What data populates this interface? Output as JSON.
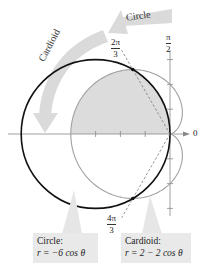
{
  "figure": {
    "pole": {
      "x": 170,
      "y": 134
    },
    "scale": 24.8,
    "colors": {
      "circle": "#111111",
      "cardioid": "#9a9a9a",
      "shade": "#dcdcdc",
      "axis": "#777777",
      "arrow_band": "#d9d9d9",
      "callout_bg": "#e9e9e9"
    },
    "axis_labels": {
      "zero": "0",
      "half_pi_num": "π",
      "half_pi_den": "2"
    },
    "angle_labels": {
      "upper": {
        "num": "2π",
        "den": "3"
      },
      "lower": {
        "num": "4π",
        "den": "3"
      }
    },
    "arrows": {
      "circle_label": "Circle",
      "cardioid_label": "Cardioid"
    },
    "callouts": {
      "circle": {
        "title": "Circle:",
        "equation": "r = −6 cos θ"
      },
      "cardioid": {
        "title": "Cardioid:",
        "equation": "r = 2 − 2 cos θ"
      }
    }
  },
  "chart_data": {
    "type": "polar",
    "title": "",
    "curves": [
      {
        "name": "Circle",
        "equation": "r = -6 cos θ",
        "style": "solid black"
      },
      {
        "name": "Cardioid",
        "equation": "r = 2 - 2 cos θ",
        "style": "solid gray"
      }
    ],
    "intersections": [
      {
        "theta": "2π/3",
        "r": 3
      },
      {
        "theta": "4π/3",
        "r": 3
      },
      {
        "theta": "pole",
        "r": 0
      }
    ],
    "shaded_region": "θ from π/2 to 2π/3 inside circle, θ from 2π/3 to π inside cardioid",
    "axis_labels": [
      "0",
      "π/2"
    ],
    "angle_rays": [
      "2π/3",
      "4π/3"
    ],
    "radial_ticks": [
      1,
      2,
      3
    ]
  }
}
